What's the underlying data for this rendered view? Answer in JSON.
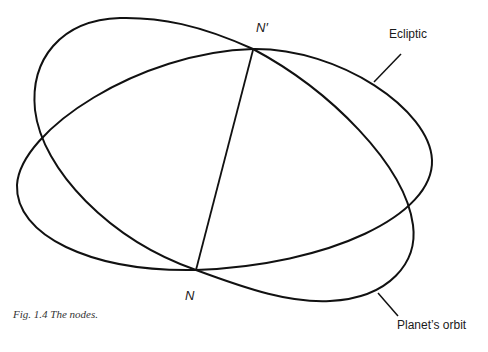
{
  "figure": {
    "caption": "Fig. 1.4 The nodes.",
    "labels": {
      "ascending_node": "N",
      "descending_node": "N′",
      "ecliptic": "Ecliptic",
      "orbit": "Planet’s orbit"
    },
    "colors": {
      "stroke": "#111111",
      "background": "#ffffff"
    }
  }
}
